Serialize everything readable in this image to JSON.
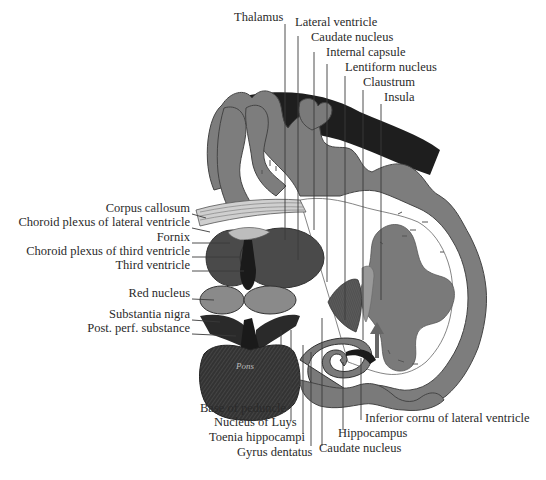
{
  "figure": {
    "pons_label": "Pons"
  },
  "labels": {
    "top": [
      {
        "id": "thalamus",
        "text": "Thalamus",
        "x": 234,
        "y": 17
      },
      {
        "id": "lateral-ventricle",
        "text": "Lateral ventricle",
        "x": 295,
        "y": 22
      },
      {
        "id": "caudate-nucleus-top",
        "text": "Caudate nucleus",
        "x": 311,
        "y": 37
      },
      {
        "id": "internal-capsule",
        "text": "Internal capsule",
        "x": 326,
        "y": 52
      },
      {
        "id": "lentiform-nucleus",
        "text": "Lentiform nucleus",
        "x": 345,
        "y": 67
      },
      {
        "id": "claustrum",
        "text": "Claustrum",
        "x": 363,
        "y": 82
      },
      {
        "id": "insula",
        "text": "Insula",
        "x": 384,
        "y": 97
      }
    ],
    "left": [
      {
        "id": "corpus-callosum",
        "text": "Corpus callosum",
        "right": 190,
        "y": 208
      },
      {
        "id": "choroid-plexus-lateral",
        "text": "Choroid plexus of lateral ventricle",
        "right": 190,
        "y": 222
      },
      {
        "id": "fornix",
        "text": "Fornix",
        "right": 190,
        "y": 237
      },
      {
        "id": "choroid-plexus-third",
        "text": "Choroid plexus of third ventricle",
        "right": 190,
        "y": 251
      },
      {
        "id": "third-ventricle",
        "text": "Third ventricle",
        "right": 190,
        "y": 265
      },
      {
        "id": "red-nucleus",
        "text": "Red nucleus",
        "right": 190,
        "y": 293
      },
      {
        "id": "substantia-nigra",
        "text": "Substantia nigra",
        "right": 190,
        "y": 314
      },
      {
        "id": "post-perf-substance",
        "text": "Post. perf. substance",
        "right": 190,
        "y": 328
      }
    ],
    "bottom": [
      {
        "id": "base-of-peduncle",
        "text": "Base of peduncle",
        "x": 200,
        "y": 408
      },
      {
        "id": "nucleus-of-luys",
        "text": "Nucleus of Luys",
        "x": 214,
        "y": 422
      },
      {
        "id": "toenia-hippocampi",
        "text": "Toenia hippocampi",
        "x": 209,
        "y": 437
      },
      {
        "id": "gyrus-dentatus",
        "text": "Gyrus dentatus",
        "x": 237,
        "y": 452
      },
      {
        "id": "caudate-nucleus-bottom",
        "text": "Caudate nucleus",
        "x": 319,
        "y": 448
      },
      {
        "id": "hippocampus",
        "text": "Hippocampus",
        "x": 338,
        "y": 433
      },
      {
        "id": "inferior-cornu",
        "text": "Inferior cornu of lateral ventricle",
        "x": 365,
        "y": 418
      }
    ]
  },
  "colors": {
    "background": "#ffffff",
    "cortex": "#7a7a7a",
    "white_matter": "#ffffff",
    "dark_mass": "#1e1e1e",
    "thalamus": "#4a4a4a",
    "light_gray": "#9a9a9a",
    "lines": "#3a3a3a"
  }
}
